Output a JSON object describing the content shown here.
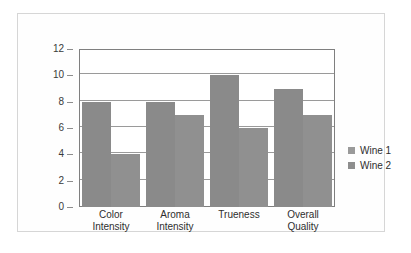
{
  "chart_data": {
    "type": "bar",
    "title": "",
    "subtitle": "",
    "xlabel": "",
    "ylabel": "",
    "ylim": [
      0,
      12
    ],
    "ytick_labels": [
      "12",
      "10",
      "8",
      "6",
      "4",
      "2",
      "0"
    ],
    "ytick_values": [
      12,
      10,
      8,
      6,
      4,
      2,
      0
    ],
    "grid": true,
    "legend_position": "right",
    "categories": [
      "Color Intensity",
      "Aroma Intensity",
      "Trueness",
      "Overall Quality"
    ],
    "category_lines": [
      [
        "Color",
        "Intensity"
      ],
      [
        "Aroma",
        "Intensity"
      ],
      [
        "Trueness",
        ""
      ],
      [
        "Overall",
        "Quality"
      ]
    ],
    "series": [
      {
        "name": "Wine 1",
        "values": [
          8,
          8,
          10,
          9
        ],
        "color": "#8a8a8a"
      },
      {
        "name": "Wine 2",
        "values": [
          4,
          7,
          6,
          7
        ],
        "color": "#909090"
      }
    ]
  },
  "legend": {
    "items": [
      {
        "label": "Wine 1",
        "color": "#9a9a9a"
      },
      {
        "label": "Wine 2",
        "color": "#8e8e8e"
      }
    ]
  },
  "style": {
    "frame_border": "#d6d6d6",
    "plot_border": "#7f7f7f",
    "gridline": "#9a9a9a",
    "text": "#2e2e2e",
    "background": "#ffffff"
  }
}
